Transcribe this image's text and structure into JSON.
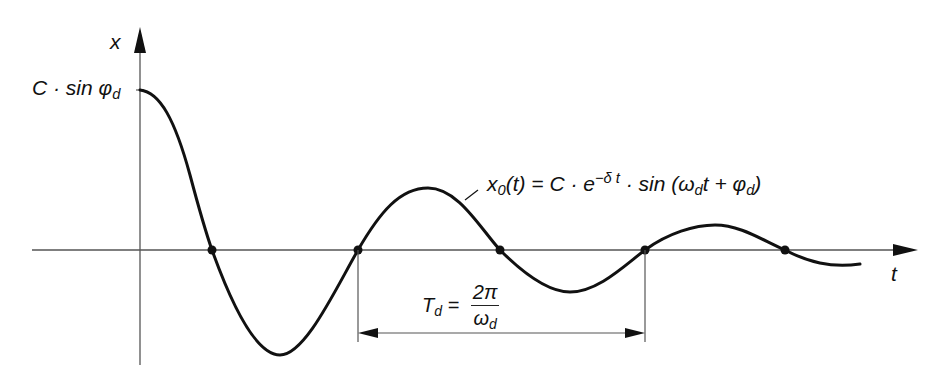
{
  "diagram": {
    "type": "damped-oscillation-plot",
    "axes": {
      "y_label": "x",
      "x_label": "t",
      "y_intercept_label": {
        "main": "C · sin φ",
        "sub": "d"
      }
    },
    "curve_label": {
      "lhs": "x",
      "lhs_sub": "0",
      "lhs_arg": "(t) = C · e",
      "exp": "−δ t",
      "rhs_pre": " · sin (ω",
      "rhs_sub1": "d",
      "rhs_mid": "t + φ",
      "rhs_sub2": "d",
      "rhs_end": ")"
    },
    "period_label": {
      "lhs": "T",
      "lhs_sub": "d",
      "eq": " =",
      "numerator": "2π",
      "denominator": "ω",
      "denominator_sub": "d"
    },
    "zero_crossings_count": 5,
    "colors": {
      "curve": "#111111",
      "axis": "#555555",
      "text": "#111111"
    }
  }
}
